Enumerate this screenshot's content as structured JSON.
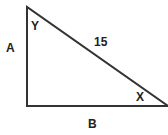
{
  "diagram": {
    "type": "right-triangle",
    "vertices": {
      "top": [
        27,
        7
      ],
      "right_angle": [
        27,
        106
      ],
      "right": [
        168,
        106
      ]
    },
    "line_color": "#333333",
    "labels": {
      "side_vertical": "A",
      "side_horizontal": "B",
      "hypotenuse": "15",
      "angle_top": "Y",
      "angle_right": "X"
    }
  }
}
